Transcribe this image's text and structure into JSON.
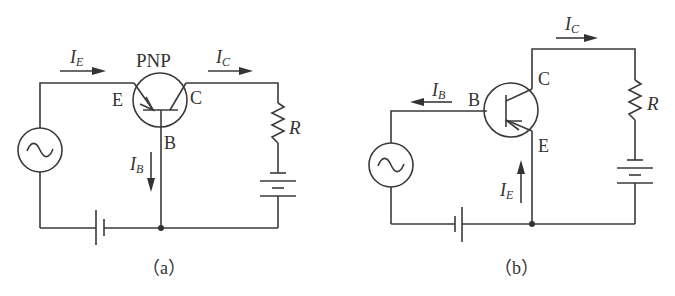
{
  "figure": {
    "panels": [
      {
        "id": "a",
        "caption": "（a）",
        "transistor_type": "PNP",
        "configuration": "common-base",
        "terminal_labels": {
          "emitter": "E",
          "collector": "C",
          "base": "B"
        },
        "currents": [
          {
            "name": "I",
            "sub": "E",
            "direction": "right"
          },
          {
            "name": "I",
            "sub": "C",
            "direction": "right"
          },
          {
            "name": "I",
            "sub": "B",
            "direction": "down"
          }
        ],
        "resistor_label": "R",
        "components": [
          "ac-source",
          "dc-battery-input",
          "pnp-transistor",
          "resistor",
          "dc-battery-output"
        ]
      },
      {
        "id": "b",
        "caption": "（b）",
        "transistor_type": "PNP",
        "configuration": "common-emitter",
        "terminal_labels": {
          "emitter": "E",
          "collector": "C",
          "base": "B"
        },
        "currents": [
          {
            "name": "I",
            "sub": "C",
            "direction": "right"
          },
          {
            "name": "I",
            "sub": "B",
            "direction": "left"
          },
          {
            "name": "I",
            "sub": "E",
            "direction": "up"
          }
        ],
        "resistor_label": "R",
        "components": [
          "ac-source",
          "dc-battery-input",
          "pnp-transistor",
          "resistor",
          "dc-battery-output"
        ]
      }
    ]
  },
  "labels": {
    "a": {
      "pnp": "PNP",
      "E": "E",
      "C": "C",
      "B": "B",
      "R": "R",
      "IE_main": "I",
      "IE_sub": "E",
      "IC_main": "I",
      "IC_sub": "C",
      "IB_main": "I",
      "IB_sub": "B",
      "caption": "（a）"
    },
    "b": {
      "E": "E",
      "C": "C",
      "B": "B",
      "R": "R",
      "IE_main": "I",
      "IE_sub": "E",
      "IC_main": "I",
      "IC_sub": "C",
      "IB_main": "I",
      "IB_sub": "B",
      "caption": "（b）"
    }
  },
  "colors": {
    "line": "#3a3a3a",
    "text": "#333333",
    "background": "#ffffff"
  }
}
